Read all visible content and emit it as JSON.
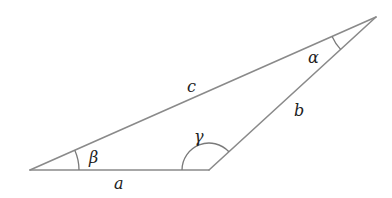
{
  "diagram": {
    "type": "triangle",
    "vertices": {
      "left": {
        "x": 30,
        "y": 170
      },
      "bottom_right": {
        "x": 209,
        "y": 170
      },
      "top_right": {
        "x": 376,
        "y": 17
      }
    },
    "sides": [
      {
        "name": "a",
        "label": "a",
        "from": "left",
        "to": "bottom_right"
      },
      {
        "name": "b",
        "label": "b",
        "from": "bottom_right",
        "to": "top_right"
      },
      {
        "name": "c",
        "label": "c",
        "from": "left",
        "to": "top_right"
      }
    ],
    "angles": [
      {
        "name": "alpha",
        "label": "α",
        "vertex": "top_right"
      },
      {
        "name": "beta",
        "label": "β",
        "vertex": "left"
      },
      {
        "name": "gamma",
        "label": "γ",
        "vertex": "bottom_right"
      }
    ],
    "labels": {
      "a": "a",
      "b": "b",
      "c": "c",
      "alpha": "α",
      "beta": "β",
      "gamma": "γ"
    },
    "colors": {
      "line": "#8a8a8a",
      "text": "#222222",
      "background": "#ffffff"
    }
  }
}
